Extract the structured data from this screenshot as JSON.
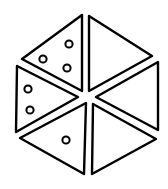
{
  "diagram": {
    "stroke_color": "#000000",
    "background": "#ffffff",
    "triangles": [
      {
        "position": "top-left",
        "dots": 3
      },
      {
        "position": "top-right",
        "dots": 0
      },
      {
        "position": "right",
        "dots": 0
      },
      {
        "position": "bottom-right",
        "dots": 0
      },
      {
        "position": "bottom-left",
        "dots": 1
      },
      {
        "position": "left",
        "dots": 2
      }
    ]
  }
}
